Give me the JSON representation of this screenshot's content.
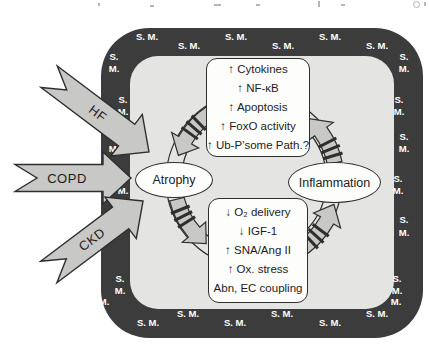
{
  "border": {
    "label": "S. M.",
    "label_s": "S.",
    "label_m": "M."
  },
  "nodes": {
    "atrophy": "Atrophy",
    "inflammation": "Inflammation"
  },
  "inputs": [
    {
      "label": "HF"
    },
    {
      "label": "COPD"
    },
    {
      "label": "CKD"
    }
  ],
  "top_box": {
    "lines": [
      "↑ Cytokines",
      "↑ NF-κB",
      "↑ Apoptosis",
      "↑ FoxO activity",
      "↑ Ub-P’some Path.?"
    ]
  },
  "bottom_box": {
    "lines": [
      "↓ O₂ delivery",
      "↓ IGF-1",
      "↑ SNA/Ang II",
      "↑ Ox. stress",
      "Abn, EC coupling"
    ]
  },
  "colors": {
    "frame": "#3c3c3c",
    "interior": "#e4e4e2",
    "arrow_fill": "#c8c8c6",
    "outline": "#2e2e2e",
    "node_fill": "#fdfdfc",
    "border_label_text": "#ffffff",
    "text": "#1c1c1c"
  }
}
